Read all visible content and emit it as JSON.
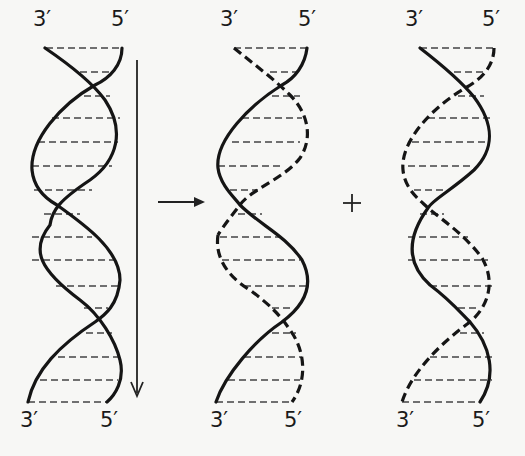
{
  "figure": {
    "helices": [
      {
        "id": "parent",
        "top_labels": {
          "left": "3′",
          "right": "5′"
        },
        "bottom_labels": {
          "left": "3′",
          "right": "5′"
        },
        "strand_styles": [
          "solid",
          "solid"
        ]
      },
      {
        "id": "daughter-1",
        "top_labels": {
          "left": "3′",
          "right": "5′"
        },
        "bottom_labels": {
          "left": "3′",
          "right": "5′"
        },
        "strand_styles": [
          "dashed",
          "solid"
        ]
      },
      {
        "id": "daughter-2",
        "top_labels": {
          "left": "3′",
          "right": "5′"
        },
        "bottom_labels": {
          "left": "3′",
          "right": "5′"
        },
        "strand_styles": [
          "solid",
          "dashed"
        ]
      }
    ],
    "operators": {
      "arrow": "→",
      "plus": "+"
    },
    "direction_arrow": "downward"
  }
}
